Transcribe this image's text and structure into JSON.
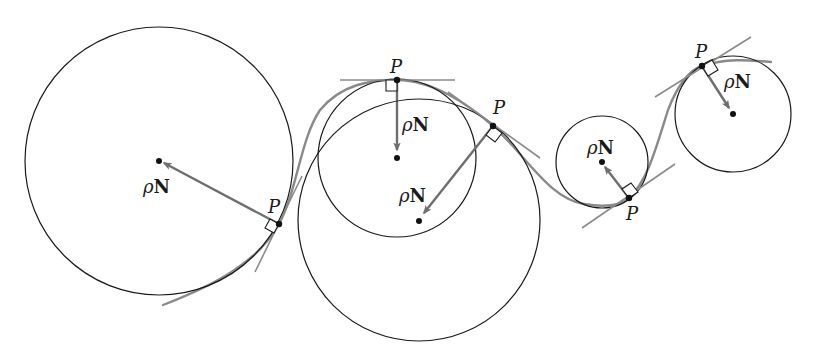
{
  "figure": {
    "colors": {
      "circle": "#1a1a1a",
      "curve": "#8a8a8a",
      "tangent": "#8a8a8a",
      "normal_arrow": "#6e6e6e",
      "point": "#111111"
    },
    "labels": {
      "point": "P",
      "rho": "ρ",
      "normal": "N"
    },
    "osculating_circles": [
      {
        "id": 1,
        "center": [
          159,
          161
        ],
        "radius": 134,
        "point": [
          279,
          224
        ],
        "point_label": "P",
        "vector_label": "ρN"
      },
      {
        "id": 2,
        "center": [
          397,
          158
        ],
        "radius": 79,
        "point": [
          397,
          80
        ],
        "point_label": "P",
        "vector_label": "ρN"
      },
      {
        "id": 3,
        "center": [
          419,
          220
        ],
        "radius": 121,
        "point": [
          493,
          126
        ],
        "point_label": "P",
        "vector_label": "ρN"
      },
      {
        "id": 4,
        "center": [
          602,
          162
        ],
        "radius": 46,
        "point": [
          629,
          198
        ],
        "point_label": "P",
        "vector_label": "ρN"
      },
      {
        "id": 5,
        "center": [
          733,
          114
        ],
        "radius": 58,
        "point": [
          702,
          66
        ],
        "point_label": "P",
        "vector_label": "ρN"
      }
    ]
  }
}
